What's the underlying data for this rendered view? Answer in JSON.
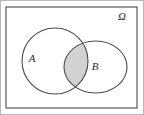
{
  "figure": {
    "kind": "venn-diagram",
    "caption": "",
    "background_color": "#ffffff",
    "frame_color": "#b9b9b9",
    "stroke_color": "#4a4a4a",
    "shade_color": "#d2d2d2"
  },
  "universe": {
    "label": "Ω",
    "shape": "rectangle",
    "x": 6,
    "y": 7,
    "width": 131,
    "height": 101,
    "label_x": 122,
    "label_y": 20
  },
  "sets": [
    {
      "id": "A",
      "label": "A",
      "shape": "circle",
      "cx": 55,
      "cy": 61,
      "rx": 33,
      "ry": 34,
      "label_x": 32,
      "label_y": 62,
      "filled": false
    },
    {
      "id": "B",
      "label": "B",
      "shape": "ellipse",
      "cx": 95.5,
      "cy": 67,
      "rx": 31.5,
      "ry": 26,
      "label_x": 95,
      "label_y": 70,
      "filled": false
    }
  ],
  "shaded_region": {
    "name": "A-intersect-B",
    "description": "intersection lens of A and B",
    "color": "#d2d2d2"
  },
  "legend": {
    "visible": false,
    "entries": []
  }
}
